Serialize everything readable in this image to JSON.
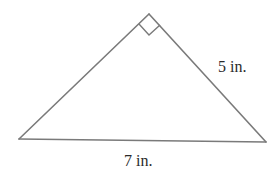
{
  "figure": {
    "type": "right-triangle",
    "right_angle_vertex": "apex",
    "colors": {
      "stroke": "#7a7a7a",
      "text": "#2a2a2a",
      "background": "#ffffff"
    }
  },
  "labels": {
    "leg": "5 in.",
    "hypotenuse": "7 in."
  }
}
